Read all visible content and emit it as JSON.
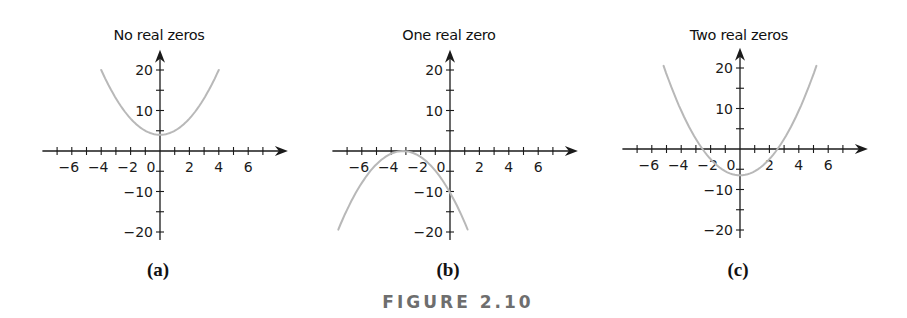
{
  "figure": {
    "label": "FIGURE 2.10",
    "label_color": "#6e6e6e",
    "curve_color": "#b8b8b8",
    "axis_color": "#1a1a1a"
  },
  "chart_data": [
    {
      "type": "line",
      "panel": "(a)",
      "title": "No real zeros",
      "function_approx": "y = x^2 + 4",
      "x_ticks": [
        -6,
        -4,
        -2,
        0,
        2,
        4,
        6
      ],
      "x_tick_labels": [
        "−6",
        "−4",
        "−2",
        "0",
        "2",
        "4",
        "6"
      ],
      "y_ticks": [
        20,
        10,
        -10,
        -20
      ],
      "y_tick_labels": [
        "20",
        "10",
        "−10",
        "−20"
      ],
      "xlim": [
        -8,
        8.7
      ],
      "ylim": [
        -22,
        25
      ],
      "minor_x_ticks_every": 1,
      "minor_y_ticks_every": 5,
      "grid": false,
      "origin_px": [
        160,
        151
      ],
      "series": [
        {
          "name": "curve",
          "x": [
            -4,
            -3,
            -2,
            -1,
            0,
            1,
            2,
            3,
            4
          ],
          "y": [
            20,
            13,
            8,
            5,
            4,
            5,
            8,
            13,
            20
          ]
        }
      ]
    },
    {
      "type": "line",
      "panel": "(b)",
      "title": "One real zero",
      "function_approx": "y = -(x + 3.2)^2",
      "x_ticks": [
        -6,
        -4,
        -2,
        0,
        2,
        4,
        6
      ],
      "x_tick_labels": [
        "−6",
        "−4",
        "−2",
        "0",
        "2",
        "4",
        "6"
      ],
      "y_ticks": [
        20,
        10,
        -10,
        -20
      ],
      "y_tick_labels": [
        "20",
        "10",
        "−10",
        "−20"
      ],
      "xlim": [
        -8,
        8.7
      ],
      "ylim": [
        -22,
        25
      ],
      "minor_x_ticks_every": 1,
      "minor_y_ticks_every": 5,
      "grid": false,
      "origin_px": [
        450,
        151
      ],
      "series": [
        {
          "name": "curve",
          "x": [
            -7.6,
            -6.6,
            -5.6,
            -4.6,
            -3.2,
            -1.8,
            -0.8,
            0,
            1.2
          ],
          "y": [
            -19.4,
            -11.6,
            -5.8,
            -2.0,
            0,
            -2.0,
            -5.8,
            -10.2,
            -19.4
          ]
        }
      ]
    },
    {
      "type": "line",
      "panel": "(c)",
      "title": "Two real zeros",
      "function_approx": "y = x^2 - 6.5",
      "x_ticks": [
        -6,
        -4,
        -2,
        0,
        2,
        4,
        6
      ],
      "x_tick_labels": [
        "−6",
        "−4",
        "−2",
        "0",
        "2",
        "4",
        "6"
      ],
      "y_ticks": [
        20,
        10,
        -10,
        -20
      ],
      "y_tick_labels": [
        "20",
        "10",
        "−10",
        "−20"
      ],
      "xlim": [
        -8,
        8.7
      ],
      "ylim": [
        -22,
        25
      ],
      "minor_x_ticks_every": 1,
      "minor_y_ticks_every": 5,
      "grid": false,
      "origin_px": [
        740,
        149
      ],
      "series": [
        {
          "name": "curve",
          "x": [
            -5.2,
            -4,
            -3,
            -2.55,
            -1,
            0,
            1,
            2.55,
            3,
            4,
            5.2
          ],
          "y": [
            20.5,
            9.5,
            2.5,
            0,
            -5.5,
            -6.5,
            -5.5,
            0,
            2.5,
            9.5,
            20.5
          ]
        }
      ]
    }
  ]
}
